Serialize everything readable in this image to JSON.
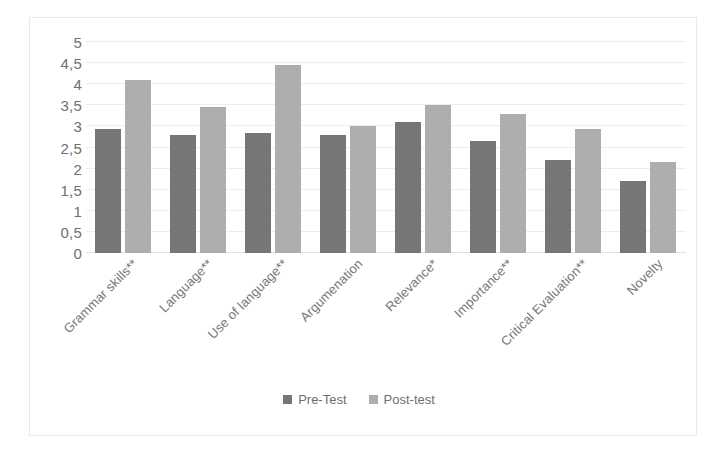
{
  "chart_data": {
    "type": "bar",
    "title": "",
    "xlabel": "",
    "ylabel": "",
    "ylim": [
      0,
      5
    ],
    "ytick_step": 0.5,
    "grid": true,
    "legend_position": "bottom",
    "decimal_separator": ",",
    "categories": [
      "Grammar skills**",
      "Language**",
      "Use of language**",
      "Argumenation",
      "Relevance*",
      "Importance**",
      "Critical Evaluation**",
      "Novelty"
    ],
    "ytick_labels": [
      "0",
      "0,5",
      "1",
      "1,5",
      "2",
      "2,5",
      "3",
      "3,5",
      "4",
      "4,5",
      "5"
    ],
    "ytick_values": [
      0,
      0.5,
      1,
      1.5,
      2,
      2.5,
      3,
      3.5,
      4,
      4.5,
      5
    ],
    "series": [
      {
        "name": "Pre-Test",
        "color": "#767676",
        "values": [
          2.95,
          2.8,
          2.85,
          2.8,
          3.1,
          2.65,
          2.2,
          1.7
        ]
      },
      {
        "name": "Post-test",
        "color": "#aeaeae",
        "values": [
          4.1,
          3.45,
          4.45,
          3.0,
          3.5,
          3.3,
          2.95,
          2.15
        ]
      }
    ]
  },
  "legend": {
    "items": [
      {
        "label": "Pre-Test",
        "color": "#767676"
      },
      {
        "label": "Post-test",
        "color": "#aeaeae"
      }
    ]
  },
  "colors": {
    "pre_test": "#767676",
    "post_test": "#aeaeae",
    "gridline": "#ededed",
    "axis_text": "#6f6f6f",
    "frame": "#e9e9e9",
    "background": "#ffffff"
  }
}
